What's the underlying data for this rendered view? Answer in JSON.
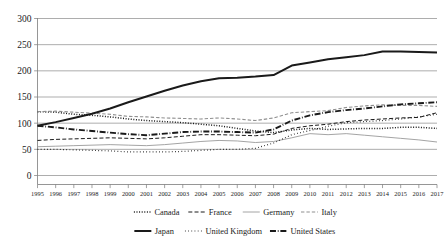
{
  "chart_data": {
    "type": "line",
    "title": "",
    "subtitle": "",
    "xlabel": "",
    "ylabel": "",
    "xlim": [
      1995,
      2017
    ],
    "ylim": [
      0,
      300
    ],
    "grid": true,
    "legend_position": "bottom",
    "yticks": [
      0,
      50,
      100,
      150,
      200,
      250,
      300
    ],
    "ytick_labels": [
      "0",
      "50",
      "100",
      "150",
      "200",
      "250",
      "300"
    ],
    "x": [
      1995,
      1996,
      1997,
      1998,
      1999,
      2000,
      2001,
      2002,
      2003,
      2004,
      2005,
      2006,
      2007,
      2008,
      2009,
      2010,
      2011,
      2012,
      2013,
      2014,
      2015,
      2016,
      2017
    ],
    "xtick_labels": [
      "1995",
      "1996",
      "1997",
      "1998",
      "1999",
      "2000",
      "2001",
      "2002",
      "2003",
      "2004",
      "2005",
      "2006",
      "2007",
      "2008",
      "2009",
      "2010",
      "2011",
      "2012",
      "2013",
      "2014",
      "2015",
      "2016",
      "2017"
    ],
    "series": [
      {
        "name": "Canada",
        "style": "dotted",
        "color": "#1a1a1a",
        "width": 1.5,
        "dasharray": "1,1.6",
        "values": [
          122,
          121,
          117,
          115,
          112,
          108,
          105,
          103,
          101,
          98,
          95,
          90,
          85,
          82,
          87,
          90,
          88,
          89,
          90,
          90,
          92,
          92,
          90
        ]
      },
      {
        "name": "France",
        "style": "dashed",
        "color": "#1a1a1a",
        "width": 1.0,
        "dasharray": "4,2.2",
        "values": [
          67,
          69,
          70,
          71,
          72,
          71,
          70,
          72,
          75,
          78,
          78,
          77,
          76,
          79,
          90,
          95,
          98,
          103,
          106,
          108,
          110,
          111,
          120
        ]
      },
      {
        "name": "Germany",
        "style": "solid-thin",
        "color": "#9a9a9a",
        "width": 0.9,
        "dasharray": "none",
        "values": [
          55,
          56,
          57,
          58,
          59,
          58,
          57,
          59,
          62,
          65,
          67,
          66,
          63,
          65,
          72,
          80,
          78,
          80,
          77,
          74,
          71,
          68,
          64
        ]
      },
      {
        "name": "Italy",
        "style": "dashed-light",
        "color": "#8f8f8f",
        "width": 1.1,
        "dasharray": "3.4,2",
        "values": [
          122,
          123,
          121,
          119,
          117,
          113,
          112,
          110,
          109,
          108,
          110,
          108,
          105,
          110,
          120,
          122,
          124,
          130,
          133,
          135,
          134,
          134,
          132
        ]
      },
      {
        "name": "Japan",
        "style": "solid-thick",
        "color": "#1a1a1a",
        "width": 2.0,
        "dasharray": "none",
        "values": [
          95,
          102,
          110,
          118,
          128,
          140,
          151,
          162,
          172,
          180,
          186,
          187,
          189,
          192,
          210,
          216,
          222,
          226,
          230,
          237,
          237,
          236,
          235
        ]
      },
      {
        "name": "United Kingdom",
        "style": "dotted-fine",
        "color": "#1a1a1a",
        "width": 1.2,
        "dasharray": "0.8,2.4",
        "values": [
          50,
          50,
          49,
          48,
          47,
          45,
          45,
          45,
          46,
          48,
          50,
          50,
          52,
          62,
          78,
          86,
          94,
          101,
          103,
          105,
          108,
          112,
          117
        ]
      },
      {
        "name": "United States",
        "style": "dash-dot",
        "color": "#1a1a1a",
        "width": 1.9,
        "dasharray": "6,1.8,0.8,1.8",
        "values": [
          95,
          92,
          88,
          85,
          82,
          79,
          77,
          80,
          83,
          84,
          84,
          83,
          82,
          88,
          105,
          115,
          121,
          125,
          128,
          132,
          136,
          138,
          140
        ]
      }
    ],
    "legend_rows": [
      [
        {
          "name": "Canada",
          "style": "dotted"
        },
        {
          "name": "France",
          "style": "dashed"
        },
        {
          "name": "Germany",
          "style": "solid-thin"
        },
        {
          "name": "Italy",
          "style": "dashed-light"
        }
      ],
      [
        {
          "name": "Japan",
          "style": "solid-thick"
        },
        {
          "name": "United Kingdom",
          "style": "dotted-fine"
        },
        {
          "name": "United States",
          "style": "dash-dot"
        }
      ]
    ]
  }
}
